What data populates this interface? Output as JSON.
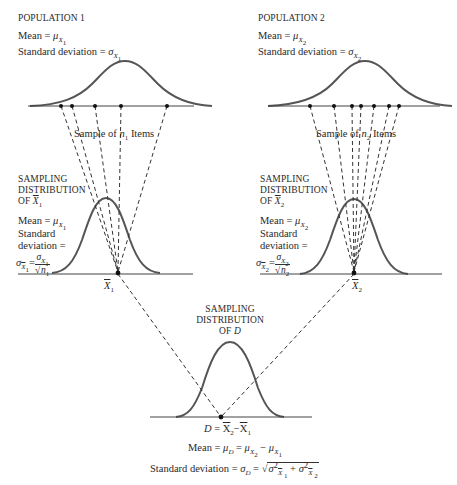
{
  "population_1": {
    "title": "POPULATION 1",
    "mean_label": "Mean =",
    "mean_symbol": "μ",
    "mean_sub": "X",
    "mean_subsub": "1",
    "sd_label": "Standard deviation =",
    "sd_symbol": "σ",
    "sd_sub": "X",
    "sd_subsub": "1",
    "sample_label_pre": "Sample of",
    "sample_n": "n",
    "sample_n_sub": "1",
    "sample_label_post": "Items",
    "sample_dots_x": [
      61,
      72,
      95,
      121,
      167
    ]
  },
  "population_2": {
    "title": "POPULATION 2",
    "mean_label": "Mean =",
    "mean_symbol": "μ",
    "mean_sub": "X",
    "mean_subsub": "2",
    "sd_label": "Standard deviation =",
    "sd_symbol": "σ",
    "sd_sub": "X",
    "sd_subsub": "2",
    "sample_label_pre": "Sample of",
    "sample_n": "n",
    "sample_n_sub": "2",
    "sample_label_post": "Items",
    "sample_dots_x": [
      310,
      334,
      352,
      361,
      374,
      389,
      399
    ]
  },
  "sampling_1": {
    "title_line1": "SAMPLING",
    "title_line2": "DISTRIBUTION",
    "title_line3_pre": "OF",
    "title_var": "X",
    "title_var_sub": "1",
    "mean_label": "Mean =",
    "mean_symbol": "μ",
    "mean_sub": "X",
    "mean_subsub": "1",
    "sd_line1": "Standard",
    "sd_line2": "deviation =",
    "sd_symbol": "σ",
    "sd_sub": "X",
    "sd_subsub": "1",
    "frac_num_symbol": "σ",
    "frac_num_sub": "X",
    "frac_num_subsub": "1",
    "frac_den_root": "√",
    "frac_den_n": "n",
    "frac_den_sub": "1",
    "axis_label": "X",
    "axis_label_sub": "1"
  },
  "sampling_2": {
    "title_line1": "SAMPLING",
    "title_line2": "DISTRIBUTION",
    "title_line3_pre": "OF",
    "title_var": "X",
    "title_var_sub": "2",
    "mean_label": "Mean =",
    "mean_symbol": "μ",
    "mean_sub": "X",
    "mean_subsub": "2",
    "sd_line1": "Standard",
    "sd_line2": "deviation =",
    "sd_symbol": "σ",
    "sd_sub": "X",
    "sd_subsub": "2",
    "frac_num_symbol": "σ",
    "frac_num_sub": "X",
    "frac_num_subsub": "2",
    "frac_den_root": "√",
    "frac_den_n": "n",
    "frac_den_sub": "2",
    "axis_label": "X",
    "axis_label_sub": "2"
  },
  "sampling_d": {
    "title_line1": "SAMPLING",
    "title_line2": "DISTRIBUTION",
    "title_line3_pre": "OF",
    "title_var": "D",
    "axis_label_d": "D",
    "axis_eq": "=",
    "axis_x2": "X",
    "axis_x2_sub": "2",
    "axis_minus": "−",
    "axis_x1": "X",
    "axis_x1_sub": "1",
    "mean_label": "Mean =",
    "mean_mu_d": "μ",
    "mean_mu_d_sub": "D",
    "mean_eq": "=",
    "mean_mu2": "μ",
    "mean_mu2_sub": "X",
    "mean_mu2_subsub": "2",
    "mean_minus": "−",
    "mean_mu1": "μ",
    "mean_mu1_sub": "X",
    "mean_mu1_subsub": "1",
    "sd_label": "Standard deviation =",
    "sd_sigma_d": "σ",
    "sd_sigma_d_sub": "D",
    "sd_eq": "=",
    "sd_root": "√",
    "sd_term1": "σ",
    "sd_term1_sup": "2",
    "sd_term1_sub": "X",
    "sd_term1_subsub": "1",
    "sd_plus": "+",
    "sd_term2": "σ",
    "sd_term2_sup": "2",
    "sd_term2_sub": "X",
    "sd_term2_subsub": "2"
  },
  "colors": {
    "curve": "#555555",
    "line": "#333333",
    "text": "#2a2a2a"
  }
}
